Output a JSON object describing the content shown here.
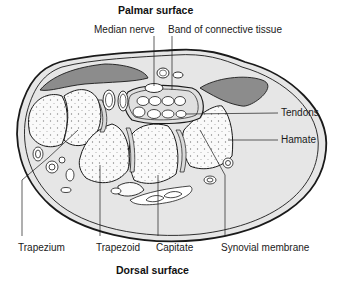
{
  "diagram": {
    "titles": {
      "top": "Palmar surface",
      "bottom": "Dorsal surface"
    },
    "labels": {
      "median_nerve": "Median nerve",
      "band": "Band of connective tissue",
      "tendons": "Tendons",
      "hamate": "Hamate",
      "trapezium": "Trapezium",
      "trapezoid": "Trapezoid",
      "capitate": "Capitate",
      "synovial": "Synovial membrane"
    },
    "colors": {
      "outline": "#1a1a1a",
      "skin_fill": "#e6e6e6",
      "muscle_fill": "#8c8c8c",
      "bone_fill": "#fafafa",
      "tendon_fill": "#ffffff",
      "background": "#ffffff"
    }
  }
}
